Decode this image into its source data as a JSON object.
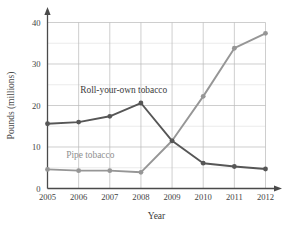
{
  "chart_data": {
    "type": "line",
    "title": "",
    "xlabel": "Year",
    "ylabel": "Pounds (millions)",
    "x": [
      2005,
      2006,
      2007,
      2008,
      2009,
      2010,
      2011,
      2012
    ],
    "xtick_labels": [
      "2005",
      "2006",
      "2007",
      "2008",
      "2009",
      "2010",
      "2011",
      "2012"
    ],
    "ytick_labels": [
      "0",
      "10",
      "20",
      "30",
      "40"
    ],
    "yticks": [
      0,
      10,
      20,
      30,
      40
    ],
    "xlim": [
      2005,
      2012
    ],
    "ylim": [
      0,
      40
    ],
    "grid": true,
    "legend_position": "inline-annotations",
    "series": [
      {
        "name": "Roll-your-own tobacco",
        "color": "#565656",
        "marker": "circle",
        "values": [
          15.6,
          16.0,
          17.4,
          20.6,
          11.5,
          6.1,
          5.3,
          4.7
        ]
      },
      {
        "name": "Pipe tobacco",
        "color": "#969696",
        "marker": "circle",
        "values": [
          4.6,
          4.3,
          4.3,
          3.9,
          11.5,
          22.2,
          33.8,
          37.4
        ]
      }
    ],
    "annotations": [
      {
        "text": "Roll-your-own tobacco",
        "x": 2006.05,
        "y": 23.0,
        "color": "#3a3a3a"
      },
      {
        "text": "Pipe tobacco",
        "x": 2005.6,
        "y": 7.3,
        "color": "#8f8f8f"
      }
    ]
  }
}
